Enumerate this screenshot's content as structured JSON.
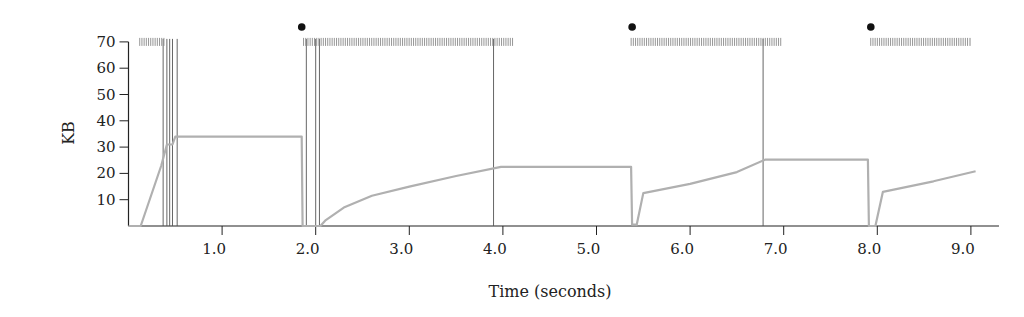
{
  "chart_data": {
    "type": "line",
    "title": "",
    "xlabel": "Time (seconds)",
    "ylabel": "KB",
    "xlim": [
      0.0,
      9.3
    ],
    "ylim": [
      0,
      70
    ],
    "x_ticks": [
      1.0,
      2.0,
      3.0,
      4.0,
      5.0,
      6.0,
      7.0,
      8.0,
      9.0
    ],
    "x_tick_labels": [
      "1.0",
      "2.0",
      "3.0",
      "4.0",
      "5.0",
      "6.0",
      "7.0",
      "8.0",
      "9.0"
    ],
    "y_ticks": [
      10,
      20,
      30,
      40,
      50,
      60,
      70
    ],
    "y_tick_labels": [
      "10",
      "20",
      "30",
      "40",
      "50",
      "60",
      "70"
    ],
    "grid": false,
    "legend": null,
    "series": [
      {
        "name": "window size (KB)",
        "color": "#b0b0b0",
        "points": [
          [
            0.0,
            0
          ],
          [
            0.13,
            0
          ],
          [
            0.35,
            23
          ],
          [
            0.41,
            31
          ],
          [
            0.47,
            31
          ],
          [
            0.5,
            34
          ],
          [
            1.85,
            34
          ],
          [
            1.86,
            0
          ],
          [
            2.05,
            0
          ],
          [
            2.1,
            2
          ],
          [
            2.3,
            7
          ],
          [
            2.6,
            11.5
          ],
          [
            3.0,
            15
          ],
          [
            3.5,
            19
          ],
          [
            3.98,
            22.5
          ],
          [
            5.37,
            22.5
          ],
          [
            5.38,
            0.5
          ],
          [
            5.43,
            0.5
          ],
          [
            5.5,
            12.5
          ],
          [
            6.0,
            16
          ],
          [
            6.5,
            20.5
          ],
          [
            6.8,
            25.2
          ],
          [
            7.9,
            25.2
          ],
          [
            7.91,
            0
          ],
          [
            7.98,
            0
          ],
          [
            8.06,
            13
          ],
          [
            8.6,
            17
          ],
          [
            9.05,
            20.8
          ]
        ]
      }
    ],
    "events": {
      "vertical_lines_s": [
        0.37,
        0.41,
        0.44,
        0.47,
        0.52,
        1.9,
        2.0,
        2.04,
        3.9,
        6.78
      ],
      "transmission_bursts": [
        {
          "start_s": 0.12,
          "end_s": 0.38,
          "y_kb": 70
        },
        {
          "start_s": 1.87,
          "end_s": 4.12,
          "y_kb": 70
        },
        {
          "start_s": 5.37,
          "end_s": 6.98,
          "y_kb": 70
        },
        {
          "start_s": 7.93,
          "end_s": 8.97,
          "y_kb": 70
        }
      ],
      "markers_s": [
        1.84,
        5.37,
        7.92
      ]
    }
  }
}
